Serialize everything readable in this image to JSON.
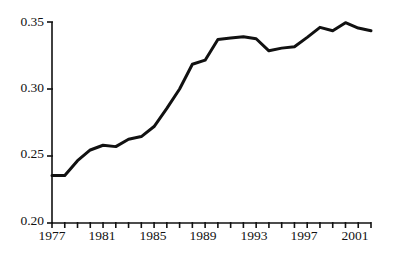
{
  "chart_data": {
    "type": "line",
    "title": "",
    "subtitle": "",
    "xlabel": "",
    "ylabel": "",
    "xlim": [
      1977,
      2002
    ],
    "ylim": [
      0.2,
      0.35
    ],
    "grid": false,
    "legend": null,
    "line_color": "#111111",
    "line_width": 3,
    "y_ticks": [
      0.2,
      0.25,
      0.3,
      0.35
    ],
    "y_tick_labels": [
      "0.20",
      "0.25",
      "0.30",
      "0.35"
    ],
    "x_ticks": [
      1977,
      1978,
      1979,
      1980,
      1981,
      1982,
      1983,
      1984,
      1985,
      1986,
      1987,
      1988,
      1989,
      1990,
      1991,
      1992,
      1993,
      1994,
      1995,
      1996,
      1997,
      1998,
      1999,
      2000,
      2001,
      2002
    ],
    "x_tick_labels": [
      "1977",
      "1981",
      "1985",
      "1989",
      "1993",
      "1997",
      "2001"
    ],
    "x_labeled_ticks": [
      1977,
      1981,
      1985,
      1989,
      1993,
      1997,
      2001
    ],
    "x": [
      1977,
      1978,
      1979,
      1980,
      1981,
      1982,
      1983,
      1984,
      1985,
      1986,
      1987,
      1988,
      1989,
      1990,
      1991,
      1992,
      1993,
      1994,
      1995,
      1996,
      1997,
      1998,
      1999,
      2000,
      2001,
      2002
    ],
    "values": [
      0.2355,
      0.2355,
      0.2465,
      0.2545,
      0.258,
      0.257,
      0.2625,
      0.2645,
      0.272,
      0.2855,
      0.3,
      0.3185,
      0.3215,
      0.337,
      0.338,
      0.339,
      0.3375,
      0.3285,
      0.3305,
      0.3315,
      0.3385,
      0.346,
      0.3435,
      0.3495,
      0.3455,
      0.3435
    ],
    "series": [
      {
        "name": "series-1",
        "values": [
          0.2355,
          0.2355,
          0.2465,
          0.2545,
          0.258,
          0.257,
          0.2625,
          0.2645,
          0.272,
          0.2855,
          0.3,
          0.3185,
          0.3215,
          0.337,
          0.338,
          0.339,
          0.3375,
          0.3285,
          0.3305,
          0.3315,
          0.3385,
          0.346,
          0.3435,
          0.3495,
          0.3455,
          0.3435
        ]
      }
    ]
  },
  "axes": {
    "y_labels": [
      "0.35",
      "0.30",
      "0.25",
      "0.20"
    ],
    "x_labels": [
      "1977",
      "1981",
      "1985",
      "1989",
      "1993",
      "1997",
      "2001"
    ]
  }
}
